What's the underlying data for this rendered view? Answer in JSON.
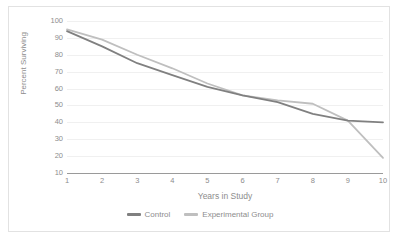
{
  "chart_data": {
    "type": "line",
    "title": "",
    "xlabel": "Years in Study",
    "ylabel": "Percent Surviving",
    "x": [
      1,
      2,
      3,
      4,
      5,
      6,
      7,
      8,
      9,
      10
    ],
    "xticklabels": [
      "1",
      "2",
      "3",
      "4",
      "5",
      "6",
      "7",
      "8",
      "9",
      "10"
    ],
    "yticklabels": [
      "10",
      "20",
      "30",
      "40",
      "50",
      "60",
      "70",
      "80",
      "90",
      "100"
    ],
    "yticks": [
      10,
      20,
      30,
      40,
      50,
      60,
      70,
      80,
      90,
      100
    ],
    "ylim": [
      10,
      100
    ],
    "xlim": [
      1,
      10
    ],
    "grid": true,
    "legend_position": "bottom-center",
    "series": [
      {
        "name": "Control",
        "color": "#808080",
        "values": [
          94,
          85,
          75,
          68,
          61,
          56,
          52,
          45,
          41,
          40
        ]
      },
      {
        "name": "Experimental Group",
        "color": "#bfbfbf",
        "values": [
          95,
          89,
          80,
          72,
          63,
          56,
          53,
          51,
          41,
          19
        ]
      }
    ]
  },
  "axes": {
    "y_title": "Percent Surviving",
    "x_title": "Years in Study"
  },
  "legend": {
    "items": [
      {
        "label": "Control",
        "color": "#808080"
      },
      {
        "label": "Experimental Group",
        "color": "#bfbfbf"
      }
    ]
  },
  "colors": {
    "control": "#808080",
    "experimental": "#bfbfbf",
    "gridline": "#f0f0f0",
    "axis": "#9a9a9a",
    "tick_text": "#8d8d8d",
    "border": "#e2e2e2"
  }
}
